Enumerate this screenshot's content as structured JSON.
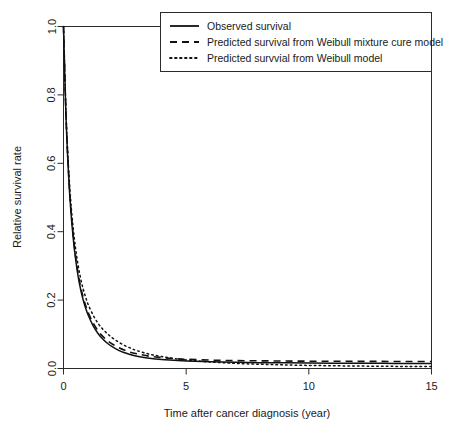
{
  "chart_data": {
    "type": "line",
    "title": "",
    "xlabel": "Time after cancer diagnosis (year)",
    "ylabel": "Relative survival rate",
    "xlim": [
      0,
      15
    ],
    "ylim": [
      0.0,
      1.0
    ],
    "xticks": [
      0,
      5,
      10,
      15
    ],
    "xticklabels": [
      "0",
      "5",
      "10",
      "15"
    ],
    "yticks": [
      0.0,
      0.2,
      0.4,
      0.6,
      0.8,
      1.0
    ],
    "yticklabels": [
      "0.0",
      "0.2",
      "0.4",
      "0.6",
      "0.8",
      "1.0"
    ],
    "grid": false,
    "legend_position": "top-right",
    "x": [
      0,
      0.1,
      0.2,
      0.3,
      0.4,
      0.5,
      0.6,
      0.7,
      0.8,
      0.9,
      1.0,
      1.2,
      1.4,
      1.6,
      1.8,
      2.0,
      2.25,
      2.5,
      2.75,
      3.0,
      3.5,
      4.0,
      4.5,
      5.0,
      6.0,
      7.0,
      8.0,
      9.0,
      10.0,
      11.0,
      12.0,
      13.0,
      14.0,
      15.0
    ],
    "series": [
      {
        "name": "Observed survival",
        "style": "solid",
        "color": "#111111",
        "values": [
          1.0,
          0.74,
          0.575,
          0.46,
          0.378,
          0.316,
          0.268,
          0.231,
          0.201,
          0.177,
          0.157,
          0.126,
          0.103,
          0.086,
          0.073,
          0.063,
          0.053,
          0.046,
          0.04,
          0.036,
          0.03,
          0.026,
          0.024,
          0.022,
          0.0195,
          0.018,
          0.017,
          0.0165,
          0.016,
          0.0155,
          0.0152,
          0.015,
          0.0148,
          0.0146
        ]
      },
      {
        "name": "Predicted survival from Weibull mixture cure model",
        "style": "dashed",
        "color": "#111111",
        "values": [
          1.0,
          0.745,
          0.582,
          0.468,
          0.386,
          0.324,
          0.276,
          0.239,
          0.209,
          0.185,
          0.165,
          0.134,
          0.111,
          0.094,
          0.081,
          0.071,
          0.061,
          0.053,
          0.047,
          0.043,
          0.036,
          0.032,
          0.029,
          0.027,
          0.0245,
          0.0232,
          0.0224,
          0.0218,
          0.0214,
          0.0211,
          0.0209,
          0.0207,
          0.0206,
          0.0205
        ]
      },
      {
        "name": "Predicted survvial from Weibull model",
        "style": "dotted",
        "color": "#111111",
        "values": [
          1.0,
          0.752,
          0.594,
          0.485,
          0.407,
          0.347,
          0.3,
          0.263,
          0.233,
          0.209,
          0.188,
          0.157,
          0.133,
          0.115,
          0.101,
          0.089,
          0.077,
          0.067,
          0.059,
          0.052,
          0.042,
          0.035,
          0.029,
          0.025,
          0.019,
          0.015,
          0.0125,
          0.0105,
          0.009,
          0.008,
          0.0072,
          0.0065,
          0.006,
          0.0055
        ]
      }
    ]
  },
  "legend": {
    "entries": [
      {
        "label": "Observed survival",
        "style": "solid"
      },
      {
        "label": "Predicted survival from Weibull mixture cure model",
        "style": "dashed"
      },
      {
        "label": "Predicted survvial from Weibull model",
        "style": "dotted"
      }
    ]
  }
}
